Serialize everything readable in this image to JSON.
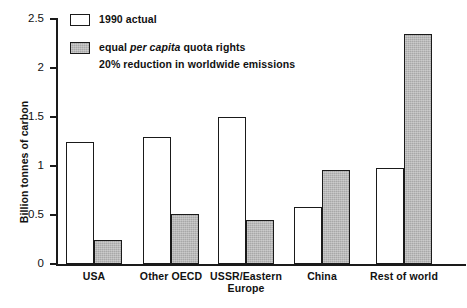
{
  "chart_data": {
    "type": "bar",
    "title": "",
    "xlabel": "",
    "ylabel": "Billion tonnes of carbon",
    "ylim": [
      0,
      2.5
    ],
    "yticks": [
      "0",
      "0.5",
      "1",
      "1.5",
      "2",
      "2.5"
    ],
    "ytick_values": [
      0,
      0.5,
      1,
      1.5,
      2,
      2.5
    ],
    "grid": false,
    "legend_position": "top-left",
    "categories": [
      "USA",
      "Other OECD",
      "USSR/Eastern\nEurope",
      "China",
      "Rest of world"
    ],
    "series": [
      {
        "name": "1990 actual",
        "fill": "white",
        "values": [
          1.25,
          1.3,
          1.5,
          0.58,
          0.98
        ]
      },
      {
        "name": "equal per capita quota rights",
        "fill": "gray",
        "values": [
          0.24,
          0.51,
          0.45,
          0.96,
          2.35
        ]
      }
    ]
  },
  "legend": {
    "entries": [
      {
        "swatch": "white",
        "label": "1990 actual",
        "sublabel": ""
      },
      {
        "swatch": "gray",
        "label_pre": "equal ",
        "label_italic": "per capita",
        "label_post": " quota rights",
        "sublabel": "20% reduction in worldwide emissions"
      }
    ]
  },
  "colors": {
    "bar_gray": "#a8a8a8",
    "bar_white": "#ffffff",
    "outline": "#1a1a1a",
    "background": "#ffffff"
  }
}
